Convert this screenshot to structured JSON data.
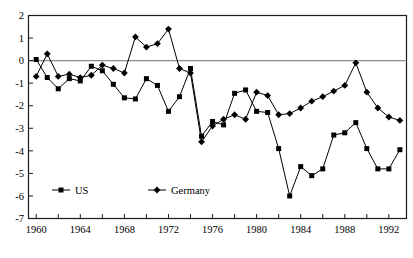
{
  "chart_data": {
    "type": "line",
    "title": "",
    "xlabel": "",
    "ylabel": "",
    "xlim": [
      1959.3,
      1993.6
    ],
    "ylim": [
      -7,
      2
    ],
    "grid": false,
    "zero_line": true,
    "legend_position": "inside-lower-left",
    "y_ticks": [
      2,
      1,
      0,
      -1,
      -2,
      -3,
      -4,
      -5,
      -6,
      -7
    ],
    "y_tick_labels": [
      "2",
      "1",
      "0",
      "-1",
      "-2",
      "-3",
      "-4",
      "-5",
      "-6",
      "-7"
    ],
    "x_ticks": [
      1960,
      1962,
      1964,
      1966,
      1968,
      1970,
      1972,
      1974,
      1976,
      1978,
      1980,
      1982,
      1984,
      1986,
      1988,
      1990,
      1992
    ],
    "x_tick_labels": [
      "1960",
      "",
      "1964",
      "",
      "1968",
      "",
      "1972",
      "",
      "1976",
      "",
      "1980",
      "",
      "1984",
      "",
      "1988",
      "",
      "1992"
    ],
    "x_labeled_ticks": [
      1960,
      1964,
      1968,
      1972,
      1976,
      1980,
      1984,
      1988,
      1992
    ],
    "series": [
      {
        "name": "US",
        "marker": "square",
        "color": "#000000",
        "x": [
          1960,
          1961,
          1962,
          1963,
          1964,
          1965,
          1966,
          1967,
          1968,
          1969,
          1970,
          1971,
          1972,
          1973,
          1974,
          1975,
          1976,
          1977,
          1978,
          1979,
          1980,
          1981,
          1982,
          1983,
          1984,
          1985,
          1986,
          1987,
          1988,
          1989,
          1990,
          1991,
          1992,
          1993
        ],
        "values": [
          0.05,
          -0.75,
          -1.25,
          -0.8,
          -0.9,
          -0.25,
          -0.45,
          -1.05,
          -1.65,
          -1.7,
          -0.8,
          -1.1,
          -2.25,
          -1.6,
          -0.35,
          -3.35,
          -2.7,
          -2.85,
          -1.45,
          -1.3,
          -2.25,
          -2.3,
          -3.9,
          -6.0,
          -4.7,
          -5.1,
          -4.8,
          -3.3,
          -3.2,
          -2.75,
          -3.9,
          -4.8,
          -4.8,
          -3.95
        ]
      },
      {
        "name": "Germany",
        "marker": "diamond",
        "color": "#000000",
        "x": [
          1960,
          1961,
          1962,
          1963,
          1964,
          1965,
          1966,
          1967,
          1968,
          1969,
          1970,
          1971,
          1972,
          1973,
          1974,
          1975,
          1976,
          1977,
          1978,
          1979,
          1980,
          1981,
          1982,
          1983,
          1984,
          1985,
          1986,
          1987,
          1988,
          1989,
          1990,
          1991,
          1992,
          1993
        ],
        "values": [
          -0.7,
          0.3,
          -0.7,
          -0.6,
          -0.75,
          -0.65,
          -0.2,
          -0.35,
          -0.55,
          1.05,
          0.6,
          0.75,
          1.4,
          -0.35,
          -0.55,
          -3.6,
          -2.9,
          -2.6,
          -2.4,
          -2.6,
          -1.4,
          -1.55,
          -2.4,
          -2.35,
          -2.1,
          -1.8,
          -1.6,
          -1.35,
          -1.1,
          -0.1,
          -1.4,
          -2.1,
          -2.5,
          -2.65
        ]
      }
    ]
  },
  "legend": {
    "items": [
      {
        "label": "US",
        "marker": "square"
      },
      {
        "label": "Germany",
        "marker": "diamond"
      }
    ]
  }
}
